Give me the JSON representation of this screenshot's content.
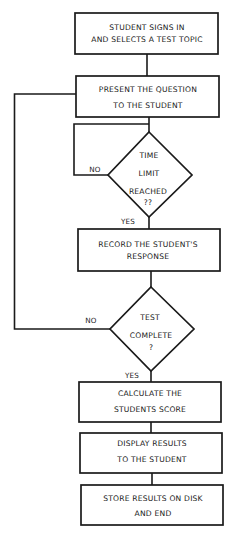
{
  "flowchart": {
    "nodes": [
      {
        "id": "start",
        "type": "process",
        "lines": [
          "STUDENT SIGNS IN",
          "AND SELECTS A TEST TOPIC"
        ]
      },
      {
        "id": "present",
        "type": "process",
        "lines": [
          "PRESENT THE QUESTION",
          "TO THE STUDENT"
        ]
      },
      {
        "id": "time_limit",
        "type": "decision",
        "lines": [
          "TIME",
          "LIMIT",
          "REACHED",
          "??"
        ]
      },
      {
        "id": "record",
        "type": "process",
        "lines": [
          "RECORD THE STUDENT'S",
          "RESPONSE"
        ]
      },
      {
        "id": "test_complete",
        "type": "decision",
        "lines": [
          "TEST",
          "COMPLETE",
          "?"
        ]
      },
      {
        "id": "calculate",
        "type": "process",
        "lines": [
          "CALCULATE THE",
          "STUDENTS SCORE"
        ]
      },
      {
        "id": "display",
        "type": "process",
        "lines": [
          "DISPLAY RESULTS",
          "TO THE STUDENT"
        ]
      },
      {
        "id": "store",
        "type": "process",
        "lines": [
          "STORE RESULTS ON DISK",
          "AND END"
        ]
      }
    ],
    "edge_labels": {
      "time_limit_no": "NO",
      "time_limit_yes": "YES",
      "test_complete_no": "NO",
      "test_complete_yes": "YES"
    },
    "colors": {
      "stroke": "#1a1a1a",
      "background": "#ffffff"
    }
  }
}
